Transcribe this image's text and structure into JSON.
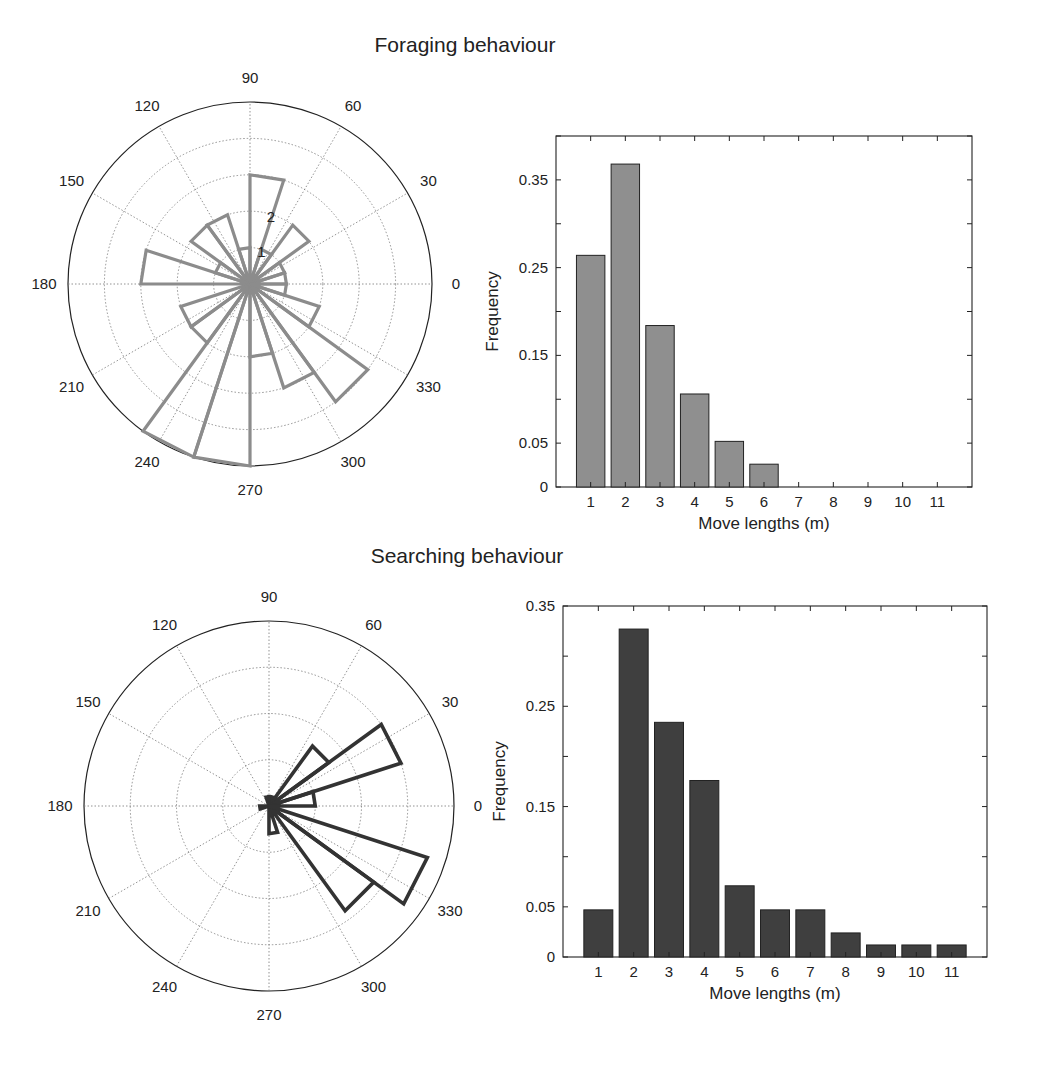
{
  "figure": {
    "panels": [
      {
        "title": "Foraging behaviour",
        "rose": {
          "angle_labels": [
            "0",
            "30",
            "60",
            "90",
            "120",
            "150",
            "180",
            "210",
            "240",
            "270",
            "300",
            "330"
          ],
          "radial_labels": [
            "1",
            "2"
          ],
          "ring_count": 5,
          "color": "#8c8c8c"
        },
        "bar": {
          "xlabel": "Move lengths (m)",
          "ylabel": "Frequency",
          "ytick_labels": [
            "0",
            "0.05",
            "0.15",
            "0.25",
            "0.35"
          ],
          "color": "#8f8f8f"
        }
      },
      {
        "title": "Searching behaviour",
        "rose": {
          "angle_labels": [
            "0",
            "30",
            "60",
            "90",
            "120",
            "150",
            "180",
            "210",
            "240",
            "270",
            "300",
            "330"
          ],
          "radial_labels": [],
          "ring_count": 4,
          "color": "#333333"
        },
        "bar": {
          "xlabel": "Move lengths (m)",
          "ylabel": "Frequency",
          "ytick_labels": [
            "0",
            "0.05",
            "0.15",
            "0.25",
            "0.35"
          ],
          "color": "#3f3f3f"
        }
      }
    ]
  },
  "chart_data": [
    {
      "type": "rose",
      "title": "Foraging behaviour (move directions)",
      "bin_width_deg": 18,
      "bin_start_deg": [
        0,
        18,
        36,
        54,
        72,
        90,
        108,
        126,
        144,
        162,
        180,
        198,
        216,
        234,
        252,
        270,
        288,
        306,
        324,
        342
      ],
      "counts": [
        1,
        1,
        2,
        1,
        3,
        1,
        2,
        2,
        1,
        3,
        0,
        2,
        2,
        5,
        5,
        2,
        3,
        4,
        2,
        1
      ],
      "radial_ticks": [
        1,
        2,
        3,
        4,
        5
      ],
      "angle_ticks_deg": [
        0,
        30,
        60,
        90,
        120,
        150,
        180,
        210,
        240,
        270,
        300,
        330
      ]
    },
    {
      "type": "bar",
      "title": "Foraging behaviour (move lengths)",
      "categories": [
        "1",
        "2",
        "3",
        "4",
        "5",
        "6",
        "7",
        "8",
        "9",
        "10",
        "11"
      ],
      "values": [
        0.264,
        0.368,
        0.184,
        0.106,
        0.052,
        0.026,
        0,
        0,
        0,
        0,
        0
      ],
      "xlabel": "Move lengths (m)",
      "ylabel": "Frequency",
      "yticks": [
        0,
        0.05,
        0.15,
        0.25,
        0.35
      ],
      "ylim": [
        0,
        0.4
      ]
    },
    {
      "type": "rose",
      "title": "Searching behaviour (move directions)",
      "bin_width_deg": 18,
      "bin_start_deg": [
        0,
        18,
        36,
        54,
        72,
        90,
        108,
        126,
        144,
        162,
        180,
        198,
        216,
        234,
        252,
        270,
        288,
        306,
        324,
        342
      ],
      "counts": [
        5,
        15,
        8,
        1,
        1,
        1,
        0,
        0,
        0,
        0,
        1,
        0,
        0,
        0,
        0,
        3,
        1,
        14,
        18,
        1
      ],
      "radial_ticks": [
        5,
        10,
        15,
        20
      ],
      "angle_ticks_deg": [
        0,
        30,
        60,
        90,
        120,
        150,
        180,
        210,
        240,
        270,
        300,
        330
      ]
    },
    {
      "type": "bar",
      "title": "Searching behaviour (move lengths)",
      "categories": [
        "1",
        "2",
        "3",
        "4",
        "5",
        "6",
        "7",
        "8",
        "9",
        "10",
        "11"
      ],
      "values": [
        0.047,
        0.327,
        0.234,
        0.176,
        0.071,
        0.047,
        0.047,
        0.024,
        0.012,
        0.012,
        0.012
      ],
      "xlabel": "Move lengths (m)",
      "ylabel": "Frequency",
      "yticks": [
        0,
        0.05,
        0.15,
        0.25,
        0.35
      ],
      "ylim": [
        0,
        0.35
      ]
    }
  ]
}
